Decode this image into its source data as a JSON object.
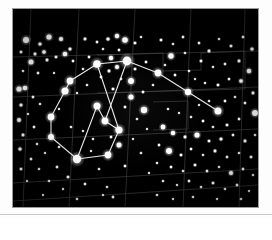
{
  "page": {
    "background_color": "#fdfdfd",
    "plate_background_color": "#000000",
    "plate_border_color": "#9a9a9a",
    "baseline_rule_color": "#c9c9c9"
  },
  "plate": {
    "title": "Orion constellation star field photograph",
    "description": "Black-and-white astronomical photographic plate showing the constellation Orion with overlaid coordinate grid and constellation stick-figure lines.",
    "width": 245,
    "height": 198,
    "star_color": "#ffffff",
    "grid_color": "#4a4a4a",
    "constellation_line_color": "#e8e8e8"
  },
  "chart_data": {
    "type": "scatter",
    "xlabel": "Right ascension (grid)",
    "ylabel": "Declination (grid)",
    "xlim": [
      0,
      245
    ],
    "ylim": [
      0,
      198
    ],
    "grid": true,
    "legend": "none",
    "grid_lines": [
      {
        "name": "grid-v-1",
        "x1": 18,
        "y1": 0,
        "x2": 10,
        "y2": 198
      },
      {
        "name": "grid-v-2",
        "x1": 66,
        "y1": 0,
        "x2": 56,
        "y2": 198
      },
      {
        "name": "grid-v-3",
        "x1": 122,
        "y1": 0,
        "x2": 112,
        "y2": 198
      },
      {
        "name": "grid-v-4",
        "x1": 178,
        "y1": 0,
        "x2": 170,
        "y2": 198
      },
      {
        "name": "grid-v-5",
        "x1": 232,
        "y1": 0,
        "x2": 226,
        "y2": 198
      },
      {
        "name": "grid-h-1",
        "x1": 0,
        "y1": 48,
        "x2": 245,
        "y2": 42
      },
      {
        "name": "grid-h-2",
        "x1": 0,
        "y1": 88,
        "x2": 245,
        "y2": 78
      },
      {
        "name": "grid-h-3",
        "x1": 0,
        "y1": 131,
        "x2": 245,
        "y2": 120
      },
      {
        "name": "grid-h-4",
        "x1": 0,
        "y1": 174,
        "x2": 245,
        "y2": 160
      },
      {
        "name": "grid-h-5",
        "x1": 0,
        "y1": 192,
        "x2": 245,
        "y2": 176
      }
    ],
    "inner_boxes": [
      {
        "name": "box-upper",
        "points": "84,46 150,44 150,62 188,61 188,44 232,42 232,80 84,84"
      },
      {
        "name": "box-lower",
        "points": "140,93 175,92 175,120 140,121"
      }
    ],
    "constellation_lines": [
      {
        "from": "betelgeuse",
        "to": "bellatrix"
      },
      {
        "from": "bellatrix",
        "to": "alnitak"
      },
      {
        "from": "betelgeuse",
        "to": "alnilam"
      },
      {
        "from": "betelgeuse",
        "to": "mu-ori"
      },
      {
        "from": "mu-ori",
        "to": "nu-ori"
      },
      {
        "from": "nu-ori",
        "to": "xi-ori"
      },
      {
        "from": "bellatrix",
        "to": "pi3-ori"
      },
      {
        "from": "pi3-ori",
        "to": "pi4-ori"
      },
      {
        "from": "pi4-ori",
        "to": "pi5-ori"
      },
      {
        "from": "pi5-ori",
        "to": "pi6-ori"
      },
      {
        "from": "pi6-ori",
        "to": "rigel"
      },
      {
        "from": "rigel",
        "to": "saiph"
      },
      {
        "from": "saiph",
        "to": "alnitak"
      },
      {
        "from": "alnitak",
        "to": "alnilam"
      },
      {
        "from": "alnilam",
        "to": "mintaka"
      },
      {
        "from": "mintaka",
        "to": "rigel"
      }
    ],
    "named_stars": [
      {
        "id": "betelgeuse",
        "x": 114,
        "y": 52,
        "r": 4.4,
        "label": "Betelgeuse"
      },
      {
        "id": "bellatrix",
        "x": 84,
        "y": 55,
        "r": 3.8,
        "label": "Bellatrix"
      },
      {
        "id": "mu-ori",
        "x": 145,
        "y": 64,
        "r": 3.4,
        "label": "Mu Ori"
      },
      {
        "id": "nu-ori",
        "x": 175,
        "y": 83,
        "r": 3.2,
        "label": "Nu Ori"
      },
      {
        "id": "xi-ori",
        "x": 205,
        "y": 102,
        "r": 3.5,
        "label": "Xi Ori"
      },
      {
        "id": "pi3-ori",
        "x": 57,
        "y": 72,
        "r": 3.4,
        "label": "Pi3 Ori"
      },
      {
        "id": "pi4-ori",
        "x": 52,
        "y": 82,
        "r": 3.6,
        "label": "Pi4 Ori"
      },
      {
        "id": "pi5-ori",
        "x": 38,
        "y": 108,
        "r": 3.4,
        "label": "Pi5 Ori"
      },
      {
        "id": "pi6-ori",
        "x": 38,
        "y": 128,
        "r": 3.0,
        "label": "Pi6 Ori"
      },
      {
        "id": "rigel",
        "x": 64,
        "y": 150,
        "r": 4.2,
        "label": "Rigel"
      },
      {
        "id": "saiph",
        "x": 95,
        "y": 146,
        "r": 3.4,
        "label": "Saiph"
      },
      {
        "id": "alnitak",
        "x": 106,
        "y": 121,
        "r": 3.6,
        "label": "Alnitak"
      },
      {
        "id": "alnilam",
        "x": 92,
        "y": 112,
        "r": 3.4,
        "label": "Alnilam"
      },
      {
        "id": "mintaka",
        "x": 84,
        "y": 97,
        "r": 3.5,
        "label": "Mintaka"
      },
      {
        "id": "branch-a",
        "x": 118,
        "y": 72,
        "r": 3.0,
        "label": "Branch A"
      },
      {
        "id": "branch-b",
        "x": 131,
        "y": 101,
        "r": 3.2,
        "label": "Branch B"
      }
    ],
    "field_stars": [
      {
        "x": 13,
        "y": 31,
        "r": 3.0
      },
      {
        "x": 27,
        "y": 35,
        "r": 1.6
      },
      {
        "x": 36,
        "y": 28,
        "r": 2.6
      },
      {
        "x": 48,
        "y": 30,
        "r": 2.0
      },
      {
        "x": 57,
        "y": 40,
        "r": 1.5
      },
      {
        "x": 22,
        "y": 45,
        "r": 1.4
      },
      {
        "x": 31,
        "y": 43,
        "r": 1.8
      },
      {
        "x": 43,
        "y": 48,
        "r": 1.3
      },
      {
        "x": 18,
        "y": 53,
        "r": 2.5
      },
      {
        "x": 34,
        "y": 51,
        "r": 1.4
      },
      {
        "x": 52,
        "y": 45,
        "r": 2.3
      },
      {
        "x": 60,
        "y": 52,
        "r": 1.2
      },
      {
        "x": 8,
        "y": 43,
        "r": 1.3
      },
      {
        "x": 10,
        "y": 62,
        "r": 1.1
      },
      {
        "x": 25,
        "y": 64,
        "r": 1.2
      },
      {
        "x": 41,
        "y": 64,
        "r": 1.0
      },
      {
        "x": 6,
        "y": 80,
        "r": 2.6
      },
      {
        "x": 12,
        "y": 79,
        "r": 2.3
      },
      {
        "x": 20,
        "y": 88,
        "r": 1.2
      },
      {
        "x": 8,
        "y": 96,
        "r": 1.5
      },
      {
        "x": 27,
        "y": 95,
        "r": 1.1
      },
      {
        "x": 15,
        "y": 105,
        "r": 1.0
      },
      {
        "x": 6,
        "y": 111,
        "r": 1.9
      },
      {
        "x": 21,
        "y": 118,
        "r": 1.2
      },
      {
        "x": 10,
        "y": 126,
        "r": 1.4
      },
      {
        "x": 24,
        "y": 135,
        "r": 1.1
      },
      {
        "x": 7,
        "y": 140,
        "r": 1.6
      },
      {
        "x": 18,
        "y": 150,
        "r": 1.2
      },
      {
        "x": 32,
        "y": 144,
        "r": 1.0
      },
      {
        "x": 8,
        "y": 160,
        "r": 1.3
      },
      {
        "x": 26,
        "y": 160,
        "r": 1.1
      },
      {
        "x": 44,
        "y": 158,
        "r": 1.2
      },
      {
        "x": 14,
        "y": 172,
        "r": 1.0
      },
      {
        "x": 36,
        "y": 172,
        "r": 1.1
      },
      {
        "x": 55,
        "y": 168,
        "r": 1.3
      },
      {
        "x": 50,
        "y": 180,
        "r": 1.0
      },
      {
        "x": 72,
        "y": 175,
        "r": 1.2
      },
      {
        "x": 94,
        "y": 178,
        "r": 1.1
      },
      {
        "x": 30,
        "y": 186,
        "r": 1.0
      },
      {
        "x": 64,
        "y": 190,
        "r": 1.1
      },
      {
        "x": 100,
        "y": 188,
        "r": 1.2
      },
      {
        "x": 72,
        "y": 30,
        "r": 1.4
      },
      {
        "x": 84,
        "y": 33,
        "r": 1.2
      },
      {
        "x": 95,
        "y": 30,
        "r": 1.6
      },
      {
        "x": 104,
        "y": 27,
        "r": 2.2
      },
      {
        "x": 112,
        "y": 31,
        "r": 2.8
      },
      {
        "x": 122,
        "y": 34,
        "r": 1.3
      },
      {
        "x": 90,
        "y": 40,
        "r": 1.1
      },
      {
        "x": 106,
        "y": 41,
        "r": 1.2
      },
      {
        "x": 128,
        "y": 28,
        "r": 1.1
      },
      {
        "x": 98,
        "y": 49,
        "r": 2.2
      },
      {
        "x": 104,
        "y": 58,
        "r": 2.0
      },
      {
        "x": 96,
        "y": 62,
        "r": 1.4
      },
      {
        "x": 122,
        "y": 60,
        "r": 1.3
      },
      {
        "x": 133,
        "y": 53,
        "r": 1.2
      },
      {
        "x": 76,
        "y": 48,
        "r": 1.2
      },
      {
        "x": 70,
        "y": 60,
        "r": 1.1
      },
      {
        "x": 88,
        "y": 68,
        "r": 1.2
      },
      {
        "x": 108,
        "y": 70,
        "r": 1.1
      },
      {
        "x": 100,
        "y": 80,
        "r": 1.3
      },
      {
        "x": 74,
        "y": 76,
        "r": 1.1
      },
      {
        "x": 64,
        "y": 84,
        "r": 1.0
      },
      {
        "x": 118,
        "y": 88,
        "r": 2.6
      },
      {
        "x": 130,
        "y": 83,
        "r": 1.2
      },
      {
        "x": 140,
        "y": 76,
        "r": 1.1
      },
      {
        "x": 112,
        "y": 98,
        "r": 1.2
      },
      {
        "x": 124,
        "y": 110,
        "r": 1.1
      },
      {
        "x": 98,
        "y": 128,
        "r": 1.2
      },
      {
        "x": 80,
        "y": 130,
        "r": 1.1
      },
      {
        "x": 70,
        "y": 122,
        "r": 1.0
      },
      {
        "x": 58,
        "y": 118,
        "r": 1.1
      },
      {
        "x": 106,
        "y": 136,
        "r": 2.5
      },
      {
        "x": 112,
        "y": 157,
        "r": 1.2
      },
      {
        "x": 86,
        "y": 160,
        "r": 1.1
      },
      {
        "x": 120,
        "y": 130,
        "r": 1.0
      },
      {
        "x": 128,
        "y": 144,
        "r": 1.1
      },
      {
        "x": 90,
        "y": 186,
        "r": 1.0
      },
      {
        "x": 148,
        "y": 31,
        "r": 1.3
      },
      {
        "x": 160,
        "y": 35,
        "r": 1.1
      },
      {
        "x": 170,
        "y": 28,
        "r": 1.2
      },
      {
        "x": 158,
        "y": 47,
        "r": 2.7
      },
      {
        "x": 172,
        "y": 44,
        "r": 1.1
      },
      {
        "x": 186,
        "y": 34,
        "r": 1.2
      },
      {
        "x": 196,
        "y": 42,
        "r": 1.4
      },
      {
        "x": 206,
        "y": 30,
        "r": 1.1
      },
      {
        "x": 218,
        "y": 37,
        "r": 1.3
      },
      {
        "x": 230,
        "y": 28,
        "r": 1.2
      },
      {
        "x": 239,
        "y": 40,
        "r": 1.6
      },
      {
        "x": 226,
        "y": 52,
        "r": 1.4
      },
      {
        "x": 212,
        "y": 55,
        "r": 1.2
      },
      {
        "x": 200,
        "y": 58,
        "r": 1.1
      },
      {
        "x": 188,
        "y": 52,
        "r": 1.3
      },
      {
        "x": 176,
        "y": 62,
        "r": 1.1
      },
      {
        "x": 162,
        "y": 66,
        "r": 1.2
      },
      {
        "x": 152,
        "y": 56,
        "r": 1.1
      },
      {
        "x": 236,
        "y": 62,
        "r": 2.2
      },
      {
        "x": 228,
        "y": 72,
        "r": 1.8
      },
      {
        "x": 216,
        "y": 70,
        "r": 1.2
      },
      {
        "x": 205,
        "y": 76,
        "r": 1.3
      },
      {
        "x": 192,
        "y": 74,
        "r": 1.1
      },
      {
        "x": 182,
        "y": 70,
        "r": 1.0
      },
      {
        "x": 240,
        "y": 84,
        "r": 1.4
      },
      {
        "x": 232,
        "y": 94,
        "r": 1.2
      },
      {
        "x": 222,
        "y": 88,
        "r": 1.1
      },
      {
        "x": 212,
        "y": 92,
        "r": 1.2
      },
      {
        "x": 196,
        "y": 92,
        "r": 1.1
      },
      {
        "x": 186,
        "y": 96,
        "r": 1.0
      },
      {
        "x": 242,
        "y": 104,
        "r": 2.9
      },
      {
        "x": 226,
        "y": 110,
        "r": 1.2
      },
      {
        "x": 214,
        "y": 116,
        "r": 1.3
      },
      {
        "x": 200,
        "y": 118,
        "r": 1.1
      },
      {
        "x": 190,
        "y": 112,
        "r": 1.2
      },
      {
        "x": 178,
        "y": 108,
        "r": 1.1
      },
      {
        "x": 166,
        "y": 104,
        "r": 1.0
      },
      {
        "x": 155,
        "y": 100,
        "r": 1.1
      },
      {
        "x": 150,
        "y": 118,
        "r": 2.4
      },
      {
        "x": 160,
        "y": 124,
        "r": 2.2
      },
      {
        "x": 172,
        "y": 128,
        "r": 1.4
      },
      {
        "x": 184,
        "y": 126,
        "r": 2.6
      },
      {
        "x": 196,
        "y": 132,
        "r": 1.3
      },
      {
        "x": 208,
        "y": 130,
        "r": 1.5
      },
      {
        "x": 220,
        "y": 126,
        "r": 1.2
      },
      {
        "x": 232,
        "y": 132,
        "r": 1.4
      },
      {
        "x": 242,
        "y": 126,
        "r": 1.1
      },
      {
        "x": 146,
        "y": 136,
        "r": 1.2
      },
      {
        "x": 156,
        "y": 142,
        "r": 3.0
      },
      {
        "x": 168,
        "y": 146,
        "r": 1.3
      },
      {
        "x": 178,
        "y": 140,
        "r": 1.2
      },
      {
        "x": 190,
        "y": 146,
        "r": 1.1
      },
      {
        "x": 202,
        "y": 142,
        "r": 1.4
      },
      {
        "x": 214,
        "y": 148,
        "r": 1.2
      },
      {
        "x": 226,
        "y": 144,
        "r": 1.1
      },
      {
        "x": 238,
        "y": 148,
        "r": 1.3
      },
      {
        "x": 144,
        "y": 154,
        "r": 1.1
      },
      {
        "x": 158,
        "y": 158,
        "r": 1.2
      },
      {
        "x": 170,
        "y": 162,
        "r": 1.1
      },
      {
        "x": 182,
        "y": 156,
        "r": 1.3
      },
      {
        "x": 194,
        "y": 162,
        "r": 1.2
      },
      {
        "x": 206,
        "y": 158,
        "r": 1.1
      },
      {
        "x": 218,
        "y": 164,
        "r": 2.0
      },
      {
        "x": 230,
        "y": 160,
        "r": 1.2
      },
      {
        "x": 240,
        "y": 166,
        "r": 1.1
      },
      {
        "x": 150,
        "y": 172,
        "r": 1.1
      },
      {
        "x": 164,
        "y": 176,
        "r": 1.0
      },
      {
        "x": 176,
        "y": 172,
        "r": 1.2
      },
      {
        "x": 188,
        "y": 178,
        "r": 1.1
      },
      {
        "x": 200,
        "y": 174,
        "r": 1.3
      },
      {
        "x": 212,
        "y": 180,
        "r": 1.1
      },
      {
        "x": 224,
        "y": 176,
        "r": 1.2
      },
      {
        "x": 236,
        "y": 182,
        "r": 1.0
      },
      {
        "x": 144,
        "y": 186,
        "r": 1.1
      },
      {
        "x": 160,
        "y": 190,
        "r": 1.0
      },
      {
        "x": 180,
        "y": 188,
        "r": 1.1
      },
      {
        "x": 204,
        "y": 190,
        "r": 1.0
      },
      {
        "x": 228,
        "y": 190,
        "r": 1.1
      },
      {
        "x": 136,
        "y": 164,
        "r": 1.0
      },
      {
        "x": 134,
        "y": 120,
        "r": 1.0
      },
      {
        "x": 46,
        "y": 100,
        "r": 1.0
      },
      {
        "x": 46,
        "y": 138,
        "r": 1.1
      },
      {
        "x": 78,
        "y": 142,
        "r": 1.0
      }
    ]
  }
}
